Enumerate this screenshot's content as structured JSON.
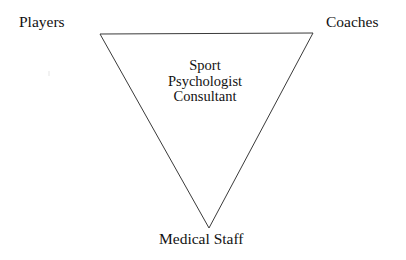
{
  "figure": {
    "type": "inverted-triangle-relationship-diagram",
    "background_color": "#ffffff",
    "stroke_color": "#3a3a3a",
    "text_color": "#121212",
    "corner_labels": {
      "top_left": "Players",
      "top_right": "Coaches",
      "bottom": "Medical Staff"
    },
    "center_label": {
      "lines": [
        "Sport",
        "Psychologist",
        "Consultant"
      ],
      "line1": "Sport",
      "line2": "Psychologist",
      "line3": "Consultant"
    },
    "geometry": {
      "vertex_top_left": "100,34",
      "vertex_top_right": "313,33",
      "vertex_bottom": "209,228",
      "stroke_width": "1"
    }
  }
}
